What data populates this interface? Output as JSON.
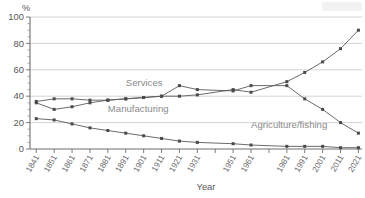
{
  "chart_data": {
    "type": "line",
    "title": "",
    "xlabel": "Year",
    "ylabel": "%",
    "ylim": [
      0,
      100
    ],
    "grid": true,
    "legend_position": "inline-annotations",
    "categories": [
      "1841",
      "1851",
      "1861",
      "1871",
      "1881",
      "1891",
      "1901",
      "1911",
      "1921",
      "1931",
      "1951",
      "1961",
      "1981",
      "1991",
      "2001",
      "2011",
      "2021"
    ],
    "tick_labels": [
      "1841",
      "1851",
      "1861",
      "1871",
      "1881",
      "1891",
      "1901",
      "1911",
      "1921",
      "1931",
      "1951",
      "1961",
      "1981",
      "1991",
      "2001",
      "2011",
      "2021"
    ],
    "y_tick_labels": [
      "0",
      "20",
      "40",
      "60",
      "80",
      "100"
    ],
    "y_ticks": [
      0,
      20,
      40,
      60,
      80,
      100
    ],
    "y_minor_step": 5,
    "series": [
      {
        "name": "Services",
        "label": "Services",
        "values": [
          35,
          30,
          32,
          35,
          37,
          38,
          39,
          40,
          40,
          41,
          45,
          43,
          51,
          58,
          66,
          76,
          90
        ]
      },
      {
        "name": "Manufacturing",
        "label": "Manufacturing",
        "values": [
          36,
          38,
          38,
          37,
          37,
          38,
          39,
          40,
          48,
          45,
          44,
          48,
          48,
          38,
          30,
          20,
          12
        ]
      },
      {
        "name": "Agriculture/fishing",
        "label": "Agriculture/fishing",
        "values": [
          23,
          22,
          19,
          16,
          14,
          12,
          10,
          8,
          6,
          5,
          4,
          3,
          2,
          2,
          2,
          1,
          1
        ]
      }
    ],
    "annotations": [
      {
        "text": "Services",
        "x": 1891,
        "y": 48
      },
      {
        "text": "Manufacturing",
        "x": 1881,
        "y": 28
      },
      {
        "text": "Agriculture/fishing",
        "x": 1961,
        "y": 16
      }
    ],
    "colors": {
      "line": "#5a5a5c",
      "marker": "#4a4a4c",
      "grid": "#c9c9cb",
      "axis": "#6e6e70",
      "text": "#58585a",
      "annotation": "#8a8a8c",
      "background": "#ffffff"
    }
  }
}
